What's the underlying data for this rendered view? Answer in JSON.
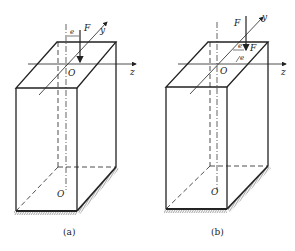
{
  "figures": [
    {
      "id": "a",
      "caption": "(a)",
      "labels": {
        "force": "F",
        "eccentricity": "e",
        "y_axis": "y",
        "z_axis": "z",
        "origin_top": "O",
        "origin_bottom": "O"
      }
    },
    {
      "id": "b",
      "caption": "(b)",
      "labels": {
        "force_top": "F",
        "force_point": "F",
        "ez": "e",
        "ey": "e",
        "y_axis": "y",
        "z_axis": "z",
        "origin_top": "O",
        "origin_bottom": "O"
      }
    }
  ],
  "colors": {
    "stroke": "#222222",
    "background": "#ffffff"
  }
}
